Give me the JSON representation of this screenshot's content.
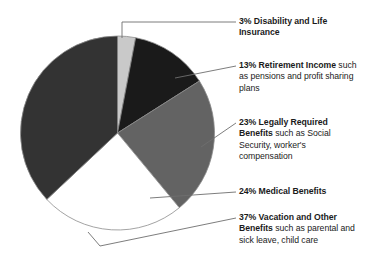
{
  "chart": {
    "title": "WHERE THE BENEFITS DOLLAR WENT IN 2002",
    "title_truncated": true
  },
  "chart_data": {
    "type": "pie",
    "title": "WHERE THE BENEFITS DOLLAR WENT IN 2002",
    "categories": [
      "Disability and Life Insurance",
      "Retirement Income",
      "Legally Required Benefits",
      "Medical Benefits",
      "Vacation and Other Benefits"
    ],
    "values": [
      3,
      13,
      23,
      24,
      37
    ],
    "unit": "percent",
    "start_angle_deg": 0,
    "direction": "clockwise",
    "legend_position": "right-callouts",
    "grid": false,
    "colors": [
      "#c9c9c9",
      "#1a1a1a",
      "#636363",
      "#ffffff",
      "#333333"
    ],
    "slice_outline": "#8c8c8c"
  },
  "callouts": [
    {
      "id": "disability",
      "percent": "3%",
      "bold": "3% Disability and Life Insurance",
      "rest": "",
      "value": 3,
      "color": "#c9c9c9"
    },
    {
      "id": "retirement",
      "percent": "13%",
      "bold": "13% Retirement Income",
      "rest": " such as pensions and profit sharing plans",
      "value": 13,
      "color": "#1a1a1a"
    },
    {
      "id": "legally",
      "percent": "23%",
      "bold": "23% Legally Required Benefits",
      "rest": " such as Social Security, worker's compensation",
      "value": 23,
      "color": "#636363"
    },
    {
      "id": "medical",
      "percent": "24%",
      "bold": "24% Medical Benefits",
      "rest": "",
      "value": 24,
      "color": "#ffffff"
    },
    {
      "id": "vacation",
      "percent": "37%",
      "bold": "37% Vacation and Other Benefits",
      "rest": " such as parental and sick leave, child care",
      "value": 37,
      "color": "#333333"
    }
  ]
}
